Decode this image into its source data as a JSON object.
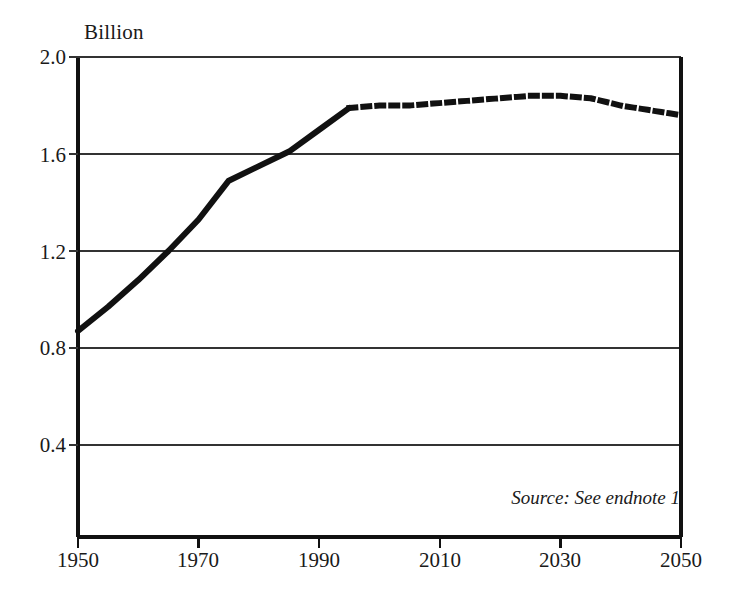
{
  "chart_data": {
    "type": "line",
    "title": "",
    "subtitle": "",
    "xlabel": "",
    "ylabel": "Billion",
    "unit_label": "Billion",
    "xlim": [
      1950,
      2050
    ],
    "ylim": [
      0.0,
      2.0
    ],
    "grid": true,
    "legend": null,
    "xticks": [
      1950,
      1970,
      1990,
      2010,
      2030,
      2050
    ],
    "xtick_labels": [
      "1950",
      "1970",
      "1990",
      "2010",
      "2030",
      "2050"
    ],
    "yticks": [
      0.4,
      0.8,
      1.2,
      1.6,
      2.0
    ],
    "ytick_labels": [
      "0.4",
      "0.8",
      "1.2",
      "1.6",
      "2.0"
    ],
    "annotations": [
      {
        "text": "Source: See endnote 1",
        "style": "italic",
        "position": "bottom-right-inside-plot"
      }
    ],
    "series": [
      {
        "name": "historical",
        "style": "solid",
        "linewidth": 6,
        "color": "#111111",
        "x": [
          1950,
          1955,
          1960,
          1965,
          1970,
          1975,
          1980,
          1985,
          1990,
          1995
        ],
        "values": [
          0.87,
          0.97,
          1.08,
          1.2,
          1.33,
          1.49,
          1.55,
          1.61,
          1.7,
          1.79
        ]
      },
      {
        "name": "projected",
        "style": "dotted",
        "linewidth": 6,
        "color": "#111111",
        "x": [
          1995,
          2000,
          2005,
          2010,
          2015,
          2020,
          2025,
          2030,
          2035,
          2040,
          2045,
          2050
        ],
        "values": [
          1.79,
          1.8,
          1.8,
          1.81,
          1.82,
          1.83,
          1.84,
          1.84,
          1.83,
          1.8,
          1.78,
          1.76
        ]
      }
    ]
  },
  "figure": {
    "unit_label": "Billion",
    "source_note": "Source: See endnote 1"
  }
}
